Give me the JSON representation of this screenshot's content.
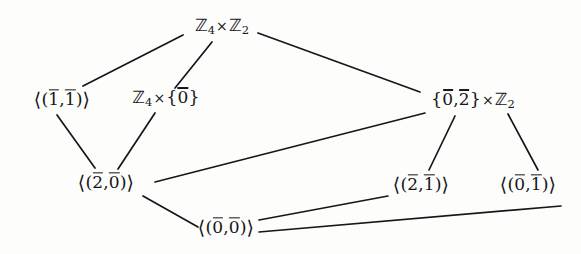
{
  "diagram": {
    "type": "lattice-hasse-diagram",
    "background_color": "#fdfdfc",
    "line_color": "#16161a",
    "text_color": "#16161a",
    "nodes": [
      {
        "id": "top",
        "label": "Z_4 x Z_2",
        "label_plain": "ℤ₄ × ℤ₂",
        "x": 222,
        "y": 27,
        "kind": "whole-group"
      },
      {
        "id": "gen11",
        "label": "<(1bar,1bar)>",
        "label_plain": "⟨(1̄,1̄)⟩",
        "x": 62,
        "y": 99,
        "kind": "cyclic-subgroup"
      },
      {
        "id": "z4times0",
        "label": "Z_4 x {0bar}",
        "label_plain": "ℤ₄ × {0̄}",
        "x": 166,
        "y": 99,
        "kind": "direct-factor"
      },
      {
        "id": "set02timesz2",
        "label": "{0bar,2bar} x Z_2",
        "label_plain": "{0̄,2̄} × ℤ₂",
        "x": 473,
        "y": 101,
        "kind": "direct-product-subgroup"
      },
      {
        "id": "gen20",
        "label": "<(2bar,0bar)>",
        "label_plain": "⟨(2̄,0̄)⟩",
        "x": 106,
        "y": 182,
        "kind": "cyclic-subgroup"
      },
      {
        "id": "gen21",
        "label": "<(2bar,1bar)>",
        "label_plain": "⟨(2̄,1̄)⟩",
        "x": 421,
        "y": 184,
        "kind": "cyclic-subgroup"
      },
      {
        "id": "gen01",
        "label": "<(0bar,1bar)>",
        "label_plain": "⟨(0̄,1̄)⟩",
        "x": 528,
        "y": 184,
        "kind": "cyclic-subgroup"
      },
      {
        "id": "gen00",
        "label": "<(0bar,0bar)>",
        "label_plain": "⟨(0̄,0̄)⟩",
        "x": 226,
        "y": 227,
        "kind": "trivial-subgroup"
      }
    ],
    "edges": [
      {
        "from": "top",
        "to": "gen11",
        "x1": 183,
        "y1": 35,
        "x2": 83,
        "y2": 86
      },
      {
        "from": "top",
        "to": "z4times0",
        "x1": 212,
        "y1": 42,
        "x2": 175,
        "y2": 88
      },
      {
        "from": "top",
        "to": "set02timesz2",
        "x1": 258,
        "y1": 33,
        "x2": 420,
        "y2": 92
      },
      {
        "from": "gen11",
        "to": "gen20",
        "x1": 57,
        "y1": 115,
        "x2": 95,
        "y2": 168
      },
      {
        "from": "z4times0",
        "to": "gen20",
        "x1": 155,
        "y1": 113,
        "x2": 118,
        "y2": 169
      },
      {
        "from": "gen20",
        "to": "set02timesz2",
        "x1": 155,
        "y1": 182,
        "x2": 425,
        "y2": 113
      },
      {
        "from": "gen20",
        "to": "gen00",
        "x1": 143,
        "y1": 196,
        "x2": 198,
        "y2": 227
      },
      {
        "from": "set02timesz2",
        "to": "gen21",
        "x1": 455,
        "y1": 116,
        "x2": 429,
        "y2": 170
      },
      {
        "from": "set02timesz2",
        "to": "gen01",
        "x1": 508,
        "y1": 114,
        "x2": 538,
        "y2": 170
      },
      {
        "from": "gen00",
        "to": "gen21",
        "x1": 259,
        "y1": 220,
        "x2": 388,
        "y2": 196
      },
      {
        "from": "gen00",
        "to": "gen01",
        "x1": 259,
        "y1": 232,
        "x2": 561,
        "y2": 206
      }
    ]
  }
}
